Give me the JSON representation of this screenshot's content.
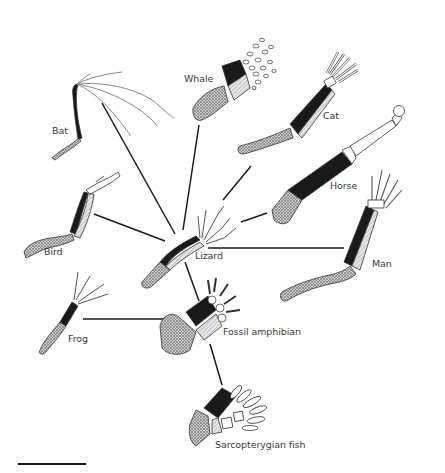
{
  "figure": {
    "center_label": "Lizard",
    "labels": [
      {
        "id": "bat",
        "text": "Bat",
        "x": 52,
        "y": 125
      },
      {
        "id": "whale",
        "text": "Whale",
        "x": 184,
        "y": 73
      },
      {
        "id": "cat",
        "text": "Cat",
        "x": 323,
        "y": 110
      },
      {
        "id": "horse",
        "text": "Horse",
        "x": 330,
        "y": 180
      },
      {
        "id": "bird",
        "text": "Bird",
        "x": 44,
        "y": 246
      },
      {
        "id": "lizard",
        "text": "Lizard",
        "x": 195,
        "y": 250
      },
      {
        "id": "man",
        "text": "Man",
        "x": 372,
        "y": 258
      },
      {
        "id": "frog",
        "text": "Frog",
        "x": 68,
        "y": 333
      },
      {
        "id": "fossil_amphibian",
        "text": "Fossil amphibian",
        "x": 223,
        "y": 326
      },
      {
        "id": "sarcopterygian_fish",
        "text": "Sarcopterygian fish",
        "x": 215,
        "y": 439
      }
    ],
    "connectors": [
      {
        "from": "lizard",
        "to": "bat",
        "x1": 175,
        "y1": 234,
        "x2": 102,
        "y2": 103
      },
      {
        "from": "lizard",
        "to": "whale",
        "x1": 183,
        "y1": 230,
        "x2": 199,
        "y2": 125
      },
      {
        "from": "lizard",
        "to": "cat",
        "x1": 223,
        "y1": 200,
        "x2": 251,
        "y2": 166
      },
      {
        "from": "lizard",
        "to": "horse",
        "x1": 241,
        "y1": 222,
        "x2": 267,
        "y2": 213
      },
      {
        "from": "lizard",
        "to": "bird",
        "x1": 165,
        "y1": 241,
        "x2": 94,
        "y2": 214
      },
      {
        "from": "lizard",
        "to": "man",
        "x1": 208,
        "y1": 248,
        "x2": 344,
        "y2": 248
      },
      {
        "from": "lizard",
        "to": "fossil_amphibian",
        "x1": 185,
        "y1": 262,
        "x2": 199,
        "y2": 301
      },
      {
        "from": "frog",
        "to": "fossil_amphibian",
        "x1": 83,
        "y1": 319,
        "x2": 175,
        "y2": 319
      },
      {
        "from": "fossil_amphibian",
        "to": "sarcopterygian_fish",
        "x1": 210,
        "y1": 344,
        "x2": 222,
        "y2": 385
      }
    ],
    "legend": {
      "humerus_color": "#b5b5b5",
      "radius_color": "#1a1a1a",
      "ulna_color": "#d0d0d0",
      "digits_color": "#ffffff",
      "line_color": "#1a1a1a"
    },
    "scale_bar": {
      "visible": true
    }
  }
}
